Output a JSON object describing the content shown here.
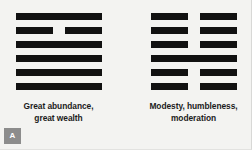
{
  "figure": {
    "panel_label": "A",
    "background_color": "#f3f3f1",
    "line_color": "#111111",
    "text_color": "#1b1b1b",
    "badge_color": "#8c8c8c"
  },
  "hexagrams": [
    {
      "id": "hexagram-left",
      "caption_line_1": "Great abundance,",
      "caption_line_2": "great wealth",
      "lines_top_to_bottom": [
        "yang",
        "yin",
        "yang",
        "yang",
        "yang",
        "yang"
      ]
    },
    {
      "id": "hexagram-right",
      "caption_line_1": "Modesty, humbleness,",
      "caption_line_2": "moderation",
      "lines_top_to_bottom": [
        "yin",
        "yin",
        "yin",
        "yang",
        "yin",
        "yin"
      ]
    }
  ]
}
